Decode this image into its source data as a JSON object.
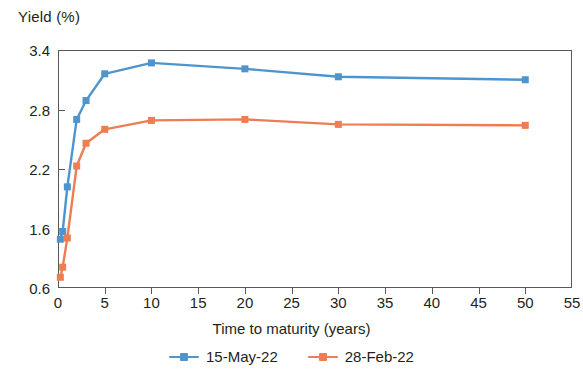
{
  "chart_data": {
    "type": "line",
    "title": "",
    "ylabel": "Yield (%)",
    "xlabel": "Time to maturity (years)",
    "x": [
      0.25,
      0.5,
      1,
      2,
      3,
      5,
      10,
      20,
      30,
      50
    ],
    "xtick_labels": [
      "0",
      "5",
      "10",
      "15",
      "20",
      "25",
      "30",
      "35",
      "40",
      "45",
      "50",
      "55"
    ],
    "xtick_values": [
      0,
      5,
      10,
      15,
      20,
      25,
      30,
      35,
      40,
      45,
      50,
      55
    ],
    "xlim": [
      0,
      55
    ],
    "ytick_labels": [
      "0.6",
      "1.6",
      "2.2",
      "2.8",
      "3.4"
    ],
    "ytick_values": [
      0.6,
      1.6,
      2.2,
      2.8,
      3.4
    ],
    "ylim": [
      0.6,
      3.4
    ],
    "grid": false,
    "legend_position": "bottom",
    "marker": "square",
    "series": [
      {
        "name": "15-May-22",
        "color": "#4E95CE",
        "values": [
          1.42,
          1.55,
          2.02,
          2.7,
          2.89,
          3.16,
          3.27,
          3.21,
          3.13,
          3.1
        ]
      },
      {
        "name": "28-Feb-22",
        "color": "#ED7D52",
        "values": [
          0.78,
          0.95,
          1.44,
          2.23,
          2.46,
          2.6,
          2.69,
          2.7,
          2.65,
          2.64
        ]
      }
    ]
  },
  "axes": {
    "y_title": "Yield (%)",
    "x_title": "Time to maturity (years)"
  },
  "legend": {
    "items": [
      {
        "label": "15-May-22",
        "color": "#4E95CE"
      },
      {
        "label": "28-Feb-22",
        "color": "#ED7D52"
      }
    ]
  },
  "colors": {
    "series_blue": "#4E95CE",
    "series_orange": "#ED7D52",
    "axis": "#58595b",
    "text": "#231f20",
    "background": "#ffffff"
  }
}
